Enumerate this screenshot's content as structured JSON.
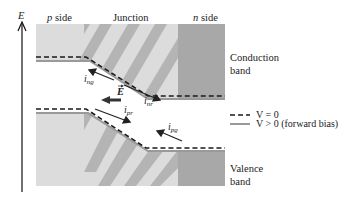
{
  "axis": {
    "label": "E"
  },
  "regions": {
    "p_side": {
      "italic": "p",
      "text": " side"
    },
    "junction": "Junction",
    "n_side": {
      "italic": "n",
      "text": " side"
    }
  },
  "bands": {
    "conduction": [
      "Conduction",
      "band"
    ],
    "valence": [
      "Valence",
      "band"
    ]
  },
  "currents": {
    "ing": {
      "main": "i",
      "sub": "ng"
    },
    "inr": {
      "main": "i",
      "sub": "nr"
    },
    "ipr": {
      "main": "i",
      "sub": "pr"
    },
    "ipg": {
      "main": "i",
      "sub": "pg"
    }
  },
  "field": {
    "label": "E"
  },
  "legend": {
    "dashed": "V = 0",
    "solid": "V > 0 (forward bias)"
  },
  "colors": {
    "light_band": "#dcdcdc",
    "stripe": "#b4b4b4",
    "n_region": "#a8a8a8",
    "forward_line": "#999999",
    "dashed_line": "#1a1a1a"
  }
}
